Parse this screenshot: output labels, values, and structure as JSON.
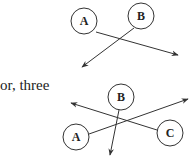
{
  "caption": "or, three",
  "diagrams": {
    "two_nodes": {
      "nodes": [
        {
          "id": "A",
          "label": "A",
          "cx": 84,
          "cy": 21,
          "r": 13
        },
        {
          "id": "B",
          "label": "B",
          "cx": 141,
          "cy": 16,
          "r": 13
        }
      ],
      "arrows": [
        {
          "from": "A",
          "x1": 96,
          "y1": 32,
          "x2": 178,
          "y2": 55
        },
        {
          "from": "B",
          "x1": 134,
          "y1": 28,
          "x2": 82,
          "y2": 67
        }
      ]
    },
    "three_nodes": {
      "nodes": [
        {
          "id": "A",
          "label": "A",
          "cx": 76,
          "cy": 137,
          "r": 13
        },
        {
          "id": "B",
          "label": "B",
          "cx": 121,
          "cy": 97,
          "r": 13
        },
        {
          "id": "C",
          "label": "C",
          "cx": 170,
          "cy": 133,
          "r": 13
        }
      ],
      "arrows": [
        {
          "from": "A",
          "x1": 89,
          "y1": 134,
          "x2": 188,
          "y2": 99
        },
        {
          "from": "C",
          "x1": 157,
          "y1": 130,
          "x2": 71,
          "y2": 103
        },
        {
          "from": "B",
          "x1": 119,
          "y1": 110,
          "x2": 110,
          "y2": 155
        }
      ]
    }
  },
  "colors": {
    "stroke": "#333333",
    "text": "#222222",
    "background": "#ffffff"
  }
}
